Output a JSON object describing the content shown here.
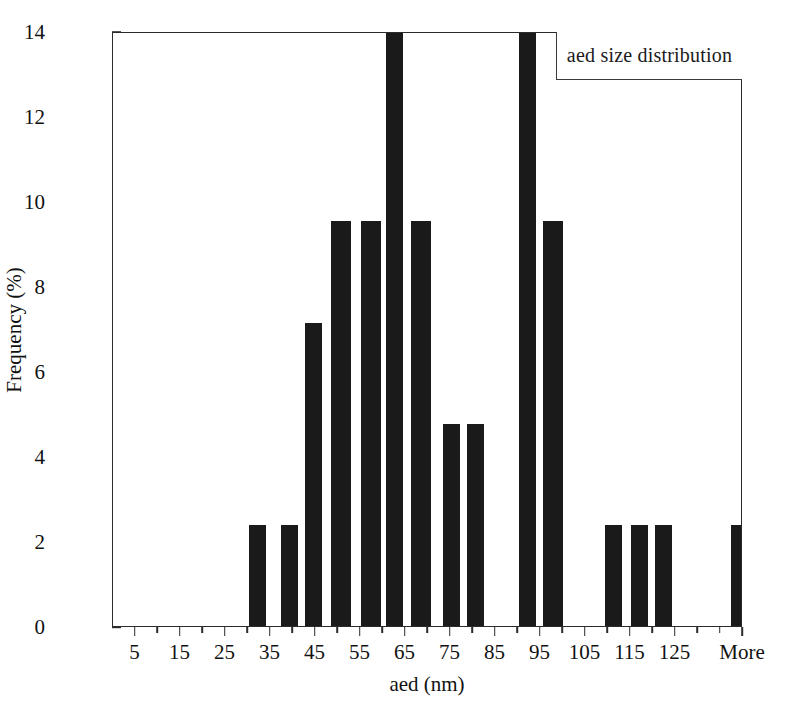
{
  "chart_data": {
    "type": "bar",
    "title": "",
    "legend": [
      "aed size distribution"
    ],
    "legend_position": "top-right",
    "xlabel": "aed (nm)",
    "ylabel": "Frequency (%)",
    "xlim": [
      0,
      140
    ],
    "ylim": [
      0,
      14
    ],
    "ytick_labels": [
      "0",
      "2",
      "4",
      "6",
      "8",
      "10",
      "12",
      "14"
    ],
    "ytick_values": [
      0,
      2,
      4,
      6,
      8,
      10,
      12,
      14
    ],
    "xtick_labels": [
      "5",
      "15",
      "25",
      "35",
      "45",
      "55",
      "65",
      "75",
      "85",
      "95",
      "105",
      "115",
      "125",
      "More"
    ],
    "xtick_values": [
      5,
      15,
      25,
      35,
      45,
      55,
      65,
      75,
      85,
      95,
      105,
      115,
      125,
      140
    ],
    "xtick_minor_values": [
      10,
      20,
      30,
      40,
      50,
      60,
      70,
      80,
      90,
      100,
      110,
      120,
      130,
      135
    ],
    "grid": false,
    "bin_width": 5,
    "categories": [
      5,
      10,
      15,
      20,
      25,
      30,
      35,
      40,
      45,
      50,
      55,
      60,
      65,
      70,
      75,
      80,
      85,
      90,
      95,
      100,
      105,
      110,
      115,
      120,
      125,
      130,
      135,
      140
    ],
    "values": [
      0,
      0,
      2.38,
      2.38,
      7.14,
      9.52,
      9.52,
      14.29,
      9.52,
      4.76,
      4.76,
      0,
      14.29,
      9.52,
      0,
      0,
      2.38,
      2.38,
      2.38,
      0,
      0,
      0,
      2.38,
      0,
      2.38,
      2.38,
      0,
      0
    ],
    "clipped_bars": [
      40,
      65
    ],
    "bar_color": "#1a1a1a",
    "bars": [
      {
        "bin": 15,
        "value": 2.38,
        "x_px": 136,
        "width_px": 17
      },
      {
        "bin": 20,
        "value": 2.38,
        "x_px": 168,
        "width_px": 17
      },
      {
        "bin": 25,
        "value": 7.14,
        "x_px": 192,
        "width_px": 17
      },
      {
        "bin": 30,
        "value": 9.52,
        "x_px": 218,
        "width_px": 20
      },
      {
        "bin": 35,
        "value": 9.52,
        "x_px": 248,
        "width_px": 20
      },
      {
        "bin": 40,
        "value": 14.29,
        "x_px": 273,
        "width_px": 17
      },
      {
        "bin": 45,
        "value": 9.52,
        "x_px": 298,
        "width_px": 20
      },
      {
        "bin": 50,
        "value": 4.76,
        "x_px": 330,
        "width_px": 17
      },
      {
        "bin": 55,
        "value": 4.76,
        "x_px": 354,
        "width_px": 17
      },
      {
        "bin": 65,
        "value": 14.29,
        "x_px": 406,
        "width_px": 17
      },
      {
        "bin": 70,
        "value": 9.52,
        "x_px": 430,
        "width_px": 20
      },
      {
        "bin": 85,
        "value": 2.38,
        "x_px": 492,
        "width_px": 17
      },
      {
        "bin": 90,
        "value": 2.38,
        "x_px": 518,
        "width_px": 17
      },
      {
        "bin": 95,
        "value": 2.38,
        "x_px": 542,
        "width_px": 17
      },
      {
        "bin": 115,
        "value": 2.38,
        "x_px": 618,
        "width_px": 17
      },
      {
        "bin": 125,
        "value": 2.38,
        "x_px": 670,
        "width_px": 17
      },
      {
        "bin": 130,
        "value": 2.38,
        "x_px": 694,
        "width_px": 17
      }
    ]
  }
}
